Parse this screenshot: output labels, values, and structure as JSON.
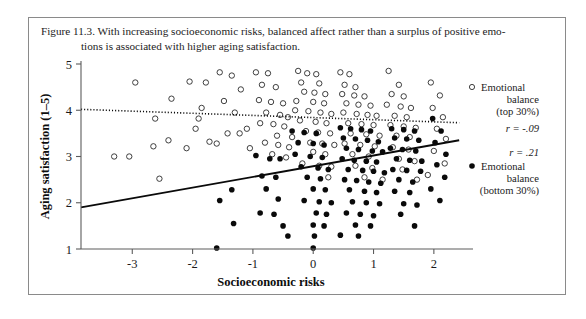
{
  "caption": {
    "line1": "Figure 11.3. With increasing socioeconomic risks, balanced affect rather than a surplus of positive emo-",
    "line2": "tions is associated with higher aging satisfaction."
  },
  "chart_data": {
    "type": "scatter",
    "title": "",
    "xlabel": "Socioeconomic risks",
    "ylabel": "Aging satisfaction (1–5)",
    "xlim": [
      -3.85,
      2.45
    ],
    "ylim": [
      1,
      5
    ],
    "xticks": [
      -3,
      -2,
      -1,
      0,
      1,
      2
    ],
    "xticklabels": [
      "-3",
      "-2",
      "-1",
      "0",
      "1",
      "2"
    ],
    "yticks": [
      1,
      2,
      3,
      4,
      5
    ],
    "yticklabels": [
      "1",
      "2",
      "3",
      "4",
      "5"
    ],
    "grid": false,
    "legend_position": "right",
    "series": [
      {
        "name": "Emotional balance (top 30%)",
        "marker": "open-circle",
        "r": "-.09",
        "r_label": "r = -.09",
        "fit_line": {
          "style": "dotted",
          "x_start": -3.85,
          "y_start": 4.02,
          "x_end": 2.42,
          "y_end": 3.73
        },
        "points": [
          [
            -2.95,
            4.6
          ],
          [
            -2.62,
            3.82
          ],
          [
            -2.65,
            3.22
          ],
          [
            -3.3,
            3.0
          ],
          [
            -3.05,
            3.0
          ],
          [
            -2.05,
            4.62
          ],
          [
            -1.78,
            4.6
          ],
          [
            -2.35,
            4.25
          ],
          [
            -1.85,
            4.05
          ],
          [
            -1.9,
            3.82
          ],
          [
            -1.95,
            3.6
          ],
          [
            -2.4,
            3.35
          ],
          [
            -1.72,
            3.32
          ],
          [
            -2.1,
            3.18
          ],
          [
            -2.55,
            2.52
          ],
          [
            -1.55,
            4.82
          ],
          [
            -1.35,
            4.75
          ],
          [
            -1.2,
            4.45
          ],
          [
            -1.48,
            4.2
          ],
          [
            -1.3,
            3.95
          ],
          [
            -1.1,
            3.6
          ],
          [
            -1.42,
            3.5
          ],
          [
            -1.22,
            3.5
          ],
          [
            -1.6,
            3.28
          ],
          [
            -1.05,
            3.18
          ],
          [
            -0.95,
            4.82
          ],
          [
            -0.75,
            4.8
          ],
          [
            -0.85,
            4.55
          ],
          [
            -0.62,
            4.5
          ],
          [
            -0.9,
            4.22
          ],
          [
            -0.7,
            4.18
          ],
          [
            -0.5,
            4.15
          ],
          [
            -0.78,
            3.95
          ],
          [
            -0.55,
            3.9
          ],
          [
            -0.42,
            3.85
          ],
          [
            -0.88,
            3.72
          ],
          [
            -0.66,
            3.7
          ],
          [
            -0.48,
            3.65
          ],
          [
            -0.6,
            3.45
          ],
          [
            -0.35,
            3.42
          ],
          [
            -0.8,
            3.3
          ],
          [
            -0.58,
            3.25
          ],
          [
            -0.4,
            3.2
          ],
          [
            -0.68,
            3.05
          ],
          [
            -0.45,
            2.98
          ],
          [
            -0.25,
            4.85
          ],
          [
            -0.1,
            4.8
          ],
          [
            0.05,
            4.78
          ],
          [
            -0.2,
            4.6
          ],
          [
            0.1,
            4.58
          ],
          [
            -0.15,
            4.4
          ],
          [
            0.02,
            4.38
          ],
          [
            0.2,
            4.35
          ],
          [
            -0.28,
            4.2
          ],
          [
            0.0,
            4.18
          ],
          [
            0.18,
            4.15
          ],
          [
            -0.3,
            4.0
          ],
          [
            -0.08,
            3.98
          ],
          [
            0.12,
            3.95
          ],
          [
            0.3,
            3.92
          ],
          [
            -0.22,
            3.78
          ],
          [
            0.04,
            3.75
          ],
          [
            0.22,
            3.72
          ],
          [
            -0.12,
            3.55
          ],
          [
            0.08,
            3.52
          ],
          [
            0.28,
            3.5
          ],
          [
            -0.05,
            3.3
          ],
          [
            0.15,
            3.28
          ],
          [
            0.35,
            3.25
          ],
          [
            0.0,
            3.1
          ],
          [
            0.2,
            3.05
          ],
          [
            -0.18,
            2.85
          ],
          [
            0.1,
            2.8
          ],
          [
            0.3,
            2.78
          ],
          [
            0.25,
            2.55
          ],
          [
            0.45,
            4.82
          ],
          [
            0.6,
            4.78
          ],
          [
            0.52,
            4.55
          ],
          [
            0.7,
            4.5
          ],
          [
            0.48,
            4.35
          ],
          [
            0.68,
            4.32
          ],
          [
            0.85,
            4.3
          ],
          [
            0.55,
            4.15
          ],
          [
            0.75,
            4.12
          ],
          [
            0.95,
            4.1
          ],
          [
            0.5,
            3.95
          ],
          [
            0.72,
            3.92
          ],
          [
            0.9,
            3.9
          ],
          [
            1.05,
            3.88
          ],
          [
            0.58,
            3.72
          ],
          [
            0.8,
            3.7
          ],
          [
            1.0,
            3.68
          ],
          [
            0.62,
            3.5
          ],
          [
            0.88,
            3.48
          ],
          [
            1.1,
            3.45
          ],
          [
            0.52,
            3.28
          ],
          [
            0.78,
            3.25
          ],
          [
            1.02,
            3.22
          ],
          [
            0.65,
            3.05
          ],
          [
            0.92,
            3.0
          ],
          [
            0.7,
            2.8
          ],
          [
            0.98,
            2.75
          ],
          [
            0.85,
            2.55
          ],
          [
            1.15,
            2.5
          ],
          [
            1.25,
            4.85
          ],
          [
            1.42,
            4.55
          ],
          [
            1.3,
            4.35
          ],
          [
            1.5,
            4.3
          ],
          [
            1.22,
            4.12
          ],
          [
            1.45,
            4.08
          ],
          [
            1.62,
            4.05
          ],
          [
            1.35,
            3.88
          ],
          [
            1.55,
            3.85
          ],
          [
            1.28,
            3.68
          ],
          [
            1.5,
            3.65
          ],
          [
            1.7,
            3.62
          ],
          [
            1.38,
            3.45
          ],
          [
            1.6,
            3.42
          ],
          [
            1.32,
            3.2
          ],
          [
            1.58,
            3.15
          ],
          [
            1.42,
            2.95
          ],
          [
            1.68,
            2.9
          ],
          [
            1.48,
            2.72
          ],
          [
            1.72,
            2.5
          ],
          [
            1.95,
            4.6
          ],
          [
            2.1,
            4.32
          ],
          [
            1.98,
            4.05
          ],
          [
            2.15,
            3.85
          ],
          [
            2.05,
            3.6
          ],
          [
            2.2,
            3.38
          ],
          [
            2.0,
            3.12
          ],
          [
            2.18,
            2.85
          ],
          [
            1.9,
            2.6
          ]
        ]
      },
      {
        "name": "Emotional balance (bottom 30%)",
        "marker": "filled-circle",
        "r": ".21",
        "r_label": "r = .21",
        "fit_line": {
          "style": "solid",
          "x_start": -3.85,
          "y_start": 1.9,
          "x_end": 2.42,
          "y_end": 3.35
        },
        "points": [
          [
            -1.6,
            1.02
          ],
          [
            -1.35,
            2.28
          ],
          [
            -1.55,
            2.05
          ],
          [
            -1.32,
            1.55
          ],
          [
            -0.95,
            3.02
          ],
          [
            -0.72,
            2.95
          ],
          [
            -0.55,
            2.95
          ],
          [
            -0.85,
            2.58
          ],
          [
            -0.62,
            2.55
          ],
          [
            -0.78,
            2.3
          ],
          [
            -0.58,
            2.08
          ],
          [
            -0.88,
            1.78
          ],
          [
            -0.65,
            1.75
          ],
          [
            -0.5,
            1.5
          ],
          [
            -0.42,
            1.28
          ],
          [
            -0.35,
            3.55
          ],
          [
            -0.15,
            3.52
          ],
          [
            0.05,
            3.5
          ],
          [
            -0.25,
            3.3
          ],
          [
            0.0,
            3.28
          ],
          [
            0.18,
            3.25
          ],
          [
            -0.3,
            3.05
          ],
          [
            -0.05,
            3.0
          ],
          [
            0.15,
            2.98
          ],
          [
            -0.2,
            2.78
          ],
          [
            0.08,
            2.75
          ],
          [
            0.25,
            2.72
          ],
          [
            -0.1,
            2.55
          ],
          [
            0.12,
            2.52
          ],
          [
            0.0,
            2.3
          ],
          [
            0.2,
            2.28
          ],
          [
            -0.15,
            2.05
          ],
          [
            0.1,
            2.02
          ],
          [
            0.3,
            2.0
          ],
          [
            0.05,
            1.78
          ],
          [
            0.22,
            1.75
          ],
          [
            0.0,
            1.52
          ],
          [
            0.18,
            1.5
          ],
          [
            0.02,
            1.28
          ],
          [
            0.0,
            1.02
          ],
          [
            0.45,
            3.62
          ],
          [
            0.62,
            3.6
          ],
          [
            0.8,
            3.58
          ],
          [
            0.95,
            3.55
          ],
          [
            0.5,
            3.4
          ],
          [
            0.7,
            3.38
          ],
          [
            0.9,
            3.35
          ],
          [
            1.08,
            3.32
          ],
          [
            0.55,
            3.18
          ],
          [
            0.75,
            3.15
          ],
          [
            0.98,
            3.12
          ],
          [
            1.15,
            3.1
          ],
          [
            0.48,
            2.95
          ],
          [
            0.68,
            2.92
          ],
          [
            0.88,
            2.9
          ],
          [
            1.05,
            2.88
          ],
          [
            0.58,
            2.72
          ],
          [
            0.82,
            2.7
          ],
          [
            1.0,
            2.68
          ],
          [
            1.18,
            2.65
          ],
          [
            0.52,
            2.5
          ],
          [
            0.72,
            2.48
          ],
          [
            0.92,
            2.45
          ],
          [
            1.12,
            2.42
          ],
          [
            0.6,
            2.28
          ],
          [
            0.85,
            2.25
          ],
          [
            1.05,
            2.22
          ],
          [
            0.65,
            2.02
          ],
          [
            0.88,
            2.0
          ],
          [
            1.1,
            1.98
          ],
          [
            0.55,
            1.78
          ],
          [
            0.78,
            1.75
          ],
          [
            1.0,
            1.72
          ],
          [
            0.7,
            1.52
          ],
          [
            0.95,
            1.5
          ],
          [
            0.45,
            1.3
          ],
          [
            0.75,
            1.28
          ],
          [
            1.3,
            3.6
          ],
          [
            1.5,
            3.58
          ],
          [
            1.68,
            3.55
          ],
          [
            1.35,
            3.4
          ],
          [
            1.55,
            3.38
          ],
          [
            1.75,
            3.35
          ],
          [
            1.28,
            3.18
          ],
          [
            1.48,
            3.15
          ],
          [
            1.7,
            3.12
          ],
          [
            1.38,
            2.95
          ],
          [
            1.6,
            2.92
          ],
          [
            1.8,
            2.9
          ],
          [
            1.32,
            2.72
          ],
          [
            1.55,
            2.7
          ],
          [
            1.78,
            2.68
          ],
          [
            1.42,
            2.5
          ],
          [
            1.65,
            2.45
          ],
          [
            1.35,
            2.25
          ],
          [
            1.6,
            2.22
          ],
          [
            1.5,
            1.98
          ],
          [
            1.72,
            1.95
          ],
          [
            1.45,
            1.75
          ],
          [
            1.68,
            1.5
          ],
          [
            1.98,
            3.82
          ],
          [
            2.12,
            3.55
          ],
          [
            2.02,
            3.3
          ],
          [
            2.2,
            3.05
          ],
          [
            2.05,
            2.82
          ],
          [
            2.18,
            2.55
          ],
          [
            1.95,
            2.3
          ],
          [
            2.1,
            2.05
          ]
        ]
      }
    ]
  },
  "legend": {
    "series1_name_l1": "Emotional",
    "series1_name_l2": "balance",
    "series1_name_l3": "(top 30%)",
    "series1_r": "r = -.09",
    "series2_r": "r = .21",
    "series2_name_l1": "Emotional",
    "series2_name_l2": "balance",
    "series2_name_l3": "(bottom 30%)"
  },
  "colors": {
    "marker": "#0a0a0a",
    "axis": "#5c5c5c",
    "text": "#1a1a1a",
    "frame": "#8a8a8a"
  }
}
